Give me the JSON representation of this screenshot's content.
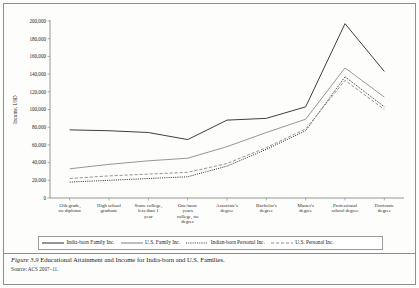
{
  "figure": {
    "number": "Figure 3.9",
    "title": "Educational Attainment and Income for India-born and U.S. Families.",
    "source": "Source: ACS 2007–11."
  },
  "chart_data": {
    "type": "line",
    "title": "",
    "xlabel": "",
    "ylabel": "Income, USD",
    "ylim": [
      0,
      200000
    ],
    "ytick_step": 20000,
    "grid": false,
    "legend_position": "bottom",
    "categories": [
      "12th grade, no diploma",
      "High school graduate",
      "Some college, less than 1 year",
      "One/more years college, no degree",
      "Associate's degree",
      "Bachelor's degree",
      "Master's degree",
      "Professional school degree",
      "Doctorate degree"
    ],
    "ytick_labels": [
      "0",
      "20,000",
      "40,000",
      "60,000",
      "80,000",
      "100,000",
      "120,000",
      "140,000",
      "160,000",
      "180,000",
      "200,000"
    ],
    "series": [
      {
        "name": "India-born Family Inc.",
        "style": "solid",
        "color": "#3f3f3f",
        "width": 1.0,
        "values": [
          77000,
          76000,
          74000,
          66000,
          88000,
          90000,
          103000,
          197000,
          143000
        ]
      },
      {
        "name": "U.S. Family Inc.",
        "style": "solid",
        "color": "#8a8a8a",
        "width": 0.9,
        "values": [
          33000,
          38000,
          42000,
          45000,
          58000,
          74000,
          89000,
          147000,
          114000
        ]
      },
      {
        "name": "Indian-born Personal Inc.",
        "style": "dotted",
        "color": "#3f3f3f",
        "width": 1.0,
        "values": [
          18000,
          20000,
          22000,
          24000,
          36000,
          55000,
          76000,
          137000,
          103000
        ]
      },
      {
        "name": "U.S. Personal Inc.",
        "style": "dashed",
        "color": "#8a8a8a",
        "width": 0.9,
        "values": [
          22000,
          25000,
          27000,
          29000,
          39000,
          57000,
          78000,
          133000,
          100000
        ]
      }
    ]
  }
}
